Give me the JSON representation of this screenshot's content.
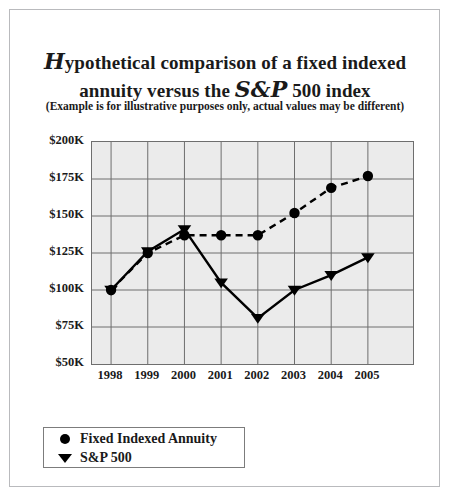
{
  "title": {
    "line1_swash": "H",
    "line1_rest": "ypothetical comparison of a fixed indexed",
    "line2_pre": "annuity versus the ",
    "line2_swash": "S&P",
    "line2_post": " 500 index",
    "full": "Hypothetical comparison of a fixed indexed annuity versus the S&P 500 index"
  },
  "subtitle": "(Example is for illustrative purposes only, actual values may be different)",
  "legend": {
    "items": [
      {
        "label": "Fixed Indexed Annuity",
        "marker": "circle-marker-icon",
        "color": "#000000"
      },
      {
        "label": "S&P 500",
        "marker": "triangle-down-marker-icon",
        "color": "#000000"
      }
    ]
  },
  "chart_data": {
    "type": "line",
    "title": "Hypothetical comparison of a fixed indexed annuity versus the S&P 500 index",
    "subtitle": "(Example is for illustrative purposes only, actual values may be different)",
    "xlabel": "",
    "ylabel": "",
    "x": [
      1998,
      1999,
      2000,
      2001,
      2002,
      2003,
      2004,
      2005
    ],
    "xtick_labels": [
      "1998",
      "1999",
      "2000",
      "2001",
      "2002",
      "2003",
      "2004",
      "2005"
    ],
    "ytick_labels": [
      "$200K",
      "$175K",
      "$150K",
      "$125K",
      "$100K",
      "$75K",
      "$50K"
    ],
    "yticks": [
      200000,
      175000,
      150000,
      125000,
      100000,
      75000,
      50000
    ],
    "ylim": [
      50000,
      200000
    ],
    "grid": true,
    "legend_position": "below-plot-left",
    "plot_background": "#ebebeb",
    "series": [
      {
        "name": "Fixed Indexed Annuity",
        "marker": "circle",
        "linestyle": "dashed",
        "color": "#000000",
        "values": [
          100000,
          125000,
          137000,
          137000,
          137000,
          152000,
          169000,
          177000
        ]
      },
      {
        "name": "S&P 500",
        "marker": "triangle-down",
        "linestyle": "solid",
        "color": "#000000",
        "values": [
          100000,
          126000,
          141000,
          105000,
          81000,
          100000,
          110000,
          122000
        ]
      }
    ]
  }
}
